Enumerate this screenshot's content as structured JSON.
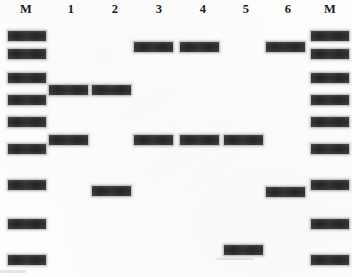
{
  "figure": {
    "kind": "dna-gel-electrophoresis",
    "width": 352,
    "height": 277,
    "background_color": "#fdfdfc",
    "band_color": "#2b2b2b",
    "lane_label_color": "#1b1b1b"
  },
  "lanes": [
    {
      "id": "lane-m-left",
      "label": "M",
      "label_x": 15,
      "is_marker": true
    },
    {
      "id": "lane-1",
      "label": "1",
      "label_x": 60,
      "is_marker": false
    },
    {
      "id": "lane-2",
      "label": "2",
      "label_x": 104,
      "is_marker": false
    },
    {
      "id": "lane-3",
      "label": "3",
      "label_x": 148,
      "is_marker": false
    },
    {
      "id": "lane-4",
      "label": "4",
      "label_x": 192,
      "is_marker": false
    },
    {
      "id": "lane-5",
      "label": "5",
      "label_x": 235,
      "is_marker": false
    },
    {
      "id": "lane-6",
      "label": "6",
      "label_x": 277,
      "is_marker": false
    },
    {
      "id": "lane-m-right",
      "label": "M",
      "label_x": 319,
      "is_marker": true
    }
  ],
  "bands": [
    {
      "lane": "lane-m-left",
      "x": 8,
      "y": 31,
      "w": 38,
      "h": 10,
      "faint": false
    },
    {
      "lane": "lane-m-left",
      "x": 8,
      "y": 49,
      "w": 38,
      "h": 10,
      "faint": false
    },
    {
      "lane": "lane-m-left",
      "x": 8,
      "y": 73,
      "w": 38,
      "h": 10,
      "faint": false
    },
    {
      "lane": "lane-m-left",
      "x": 8,
      "y": 95,
      "w": 38,
      "h": 10,
      "faint": false
    },
    {
      "lane": "lane-m-left",
      "x": 8,
      "y": 117,
      "w": 38,
      "h": 10,
      "faint": false
    },
    {
      "lane": "lane-m-left",
      "x": 8,
      "y": 144,
      "w": 38,
      "h": 10,
      "faint": false
    },
    {
      "lane": "lane-m-left",
      "x": 8,
      "y": 180,
      "w": 38,
      "h": 10,
      "faint": false
    },
    {
      "lane": "lane-m-left",
      "x": 8,
      "y": 219,
      "w": 38,
      "h": 10,
      "faint": false
    },
    {
      "lane": "lane-m-left",
      "x": 8,
      "y": 255,
      "w": 38,
      "h": 10,
      "faint": false
    },
    {
      "lane": "lane-1",
      "x": 49,
      "y": 85,
      "w": 39,
      "h": 10,
      "faint": false
    },
    {
      "lane": "lane-1",
      "x": 49,
      "y": 135,
      "w": 39,
      "h": 10,
      "faint": false
    },
    {
      "lane": "lane-2",
      "x": 92,
      "y": 85,
      "w": 39,
      "h": 10,
      "faint": false
    },
    {
      "lane": "lane-2",
      "x": 92,
      "y": 186,
      "w": 39,
      "h": 10,
      "faint": false
    },
    {
      "lane": "lane-3",
      "x": 134,
      "y": 42,
      "w": 39,
      "h": 10,
      "faint": false
    },
    {
      "lane": "lane-3",
      "x": 134,
      "y": 135,
      "w": 39,
      "h": 10,
      "faint": false
    },
    {
      "lane": "lane-4",
      "x": 180,
      "y": 42,
      "w": 39,
      "h": 10,
      "faint": false
    },
    {
      "lane": "lane-4",
      "x": 180,
      "y": 135,
      "w": 39,
      "h": 10,
      "faint": false
    },
    {
      "lane": "lane-5",
      "x": 224,
      "y": 135,
      "w": 39,
      "h": 10,
      "faint": false
    },
    {
      "lane": "lane-5",
      "x": 224,
      "y": 245,
      "w": 39,
      "h": 10,
      "faint": false
    },
    {
      "lane": "lane-6",
      "x": 266,
      "y": 42,
      "w": 39,
      "h": 10,
      "faint": false
    },
    {
      "lane": "lane-6",
      "x": 266,
      "y": 187,
      "w": 39,
      "h": 10,
      "faint": false
    },
    {
      "lane": "lane-m-right",
      "x": 311,
      "y": 31,
      "w": 38,
      "h": 10,
      "faint": false
    },
    {
      "lane": "lane-m-right",
      "x": 311,
      "y": 49,
      "w": 38,
      "h": 10,
      "faint": false
    },
    {
      "lane": "lane-m-right",
      "x": 311,
      "y": 73,
      "w": 38,
      "h": 10,
      "faint": false
    },
    {
      "lane": "lane-m-right",
      "x": 311,
      "y": 95,
      "w": 38,
      "h": 10,
      "faint": false
    },
    {
      "lane": "lane-m-right",
      "x": 311,
      "y": 117,
      "w": 38,
      "h": 10,
      "faint": false
    },
    {
      "lane": "lane-m-right",
      "x": 311,
      "y": 144,
      "w": 38,
      "h": 10,
      "faint": false
    },
    {
      "lane": "lane-m-right",
      "x": 311,
      "y": 180,
      "w": 38,
      "h": 10,
      "faint": false
    },
    {
      "lane": "lane-m-right",
      "x": 311,
      "y": 219,
      "w": 38,
      "h": 10,
      "faint": false
    },
    {
      "lane": "lane-m-right",
      "x": 311,
      "y": 255,
      "w": 38,
      "h": 10,
      "faint": false
    }
  ],
  "artifacts": [
    {
      "x": 216,
      "y": 258,
      "w": 38,
      "h": 2
    },
    {
      "x": 0,
      "y": 270,
      "w": 26,
      "h": 3
    }
  ]
}
